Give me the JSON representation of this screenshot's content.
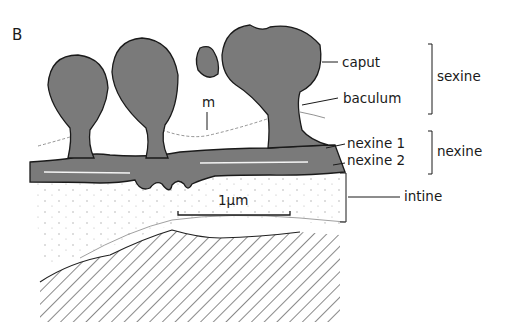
{
  "panel_label": "B",
  "labels": {
    "caput": "caput",
    "baculum": "baculum",
    "nexine1": "nexine 1",
    "nexine2": "nexine 2",
    "intine": "intine",
    "m": "m",
    "scale": "1µm"
  },
  "brackets": {
    "sexine": "sexine",
    "nexine": "nexine"
  },
  "colors": {
    "wall": "#7a7a7a",
    "outline": "#1a1a1a",
    "intine_fill": "#f4f4f2",
    "hatch": "#3a3a3a"
  }
}
